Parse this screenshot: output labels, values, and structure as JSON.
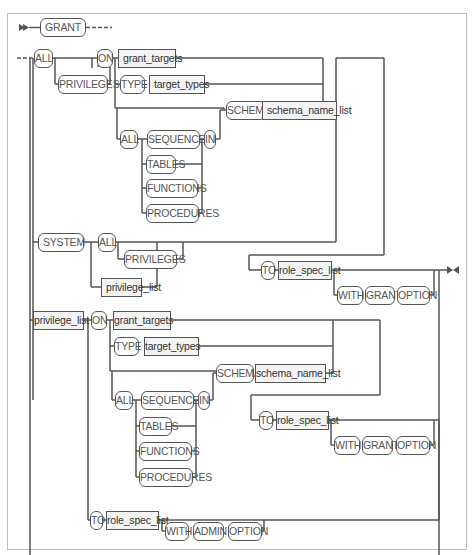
{
  "diagram": {
    "start": {
      "keyword": "GRANT"
    },
    "branch_all": {
      "all": "ALL",
      "privileges": "PRIVILEGES",
      "on": "ON",
      "grant_targets": "grant_targets",
      "type": "TYPE",
      "target_types": "target_types",
      "schema": "SCHEMA",
      "schema_name_list": "schema_name_list",
      "all_in": "ALL",
      "sequences": "SEQUENCES",
      "in": "IN",
      "tables": "TABLES",
      "functions": "FUNCTIONS",
      "procedures": "PROCEDURES"
    },
    "branch_system": {
      "system": "SYSTEM",
      "all": "ALL",
      "privileges": "PRIVILEGES",
      "privilege_list": "privilege_list"
    },
    "to_clause_1": {
      "to": "TO",
      "role_spec_list": "role_spec_list",
      "with": "WITH",
      "grant": "GRANT",
      "option": "OPTION"
    },
    "branch_privilege_list": {
      "privilege_list": "privilege_list",
      "on": "ON",
      "grant_targets": "grant_targets",
      "type": "TYPE",
      "target_types": "target_types",
      "schema": "SCHEMA",
      "schema_name_list": "schema_name_list",
      "all_in": "ALL",
      "sequences": "SEQUENCES",
      "in": "IN",
      "tables": "TABLES",
      "functions": "FUNCTIONS",
      "procedures": "PROCEDURES",
      "to": "TO",
      "role_spec_list": "role_spec_list",
      "with": "WITH",
      "grant": "GRANT",
      "option": "OPTION"
    },
    "to_clause_admin": {
      "to": "TO",
      "role_spec_list": "role_spec_list",
      "with": "WITH",
      "admin": "ADMIN",
      "option": "OPTION"
    }
  }
}
